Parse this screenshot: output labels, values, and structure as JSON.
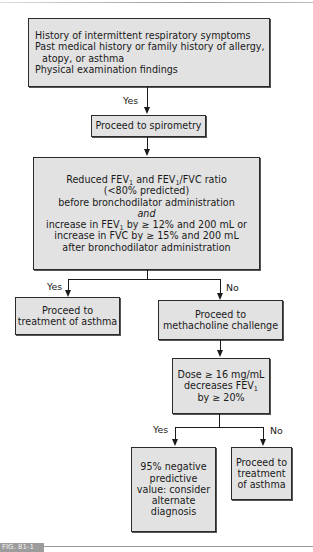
{
  "diagram": {
    "type": "flowchart",
    "nodes": {
      "history": {
        "lines": [
          "History of intermittent respiratory symptoms",
          "Past medical history or family history of allergy,",
          "atopy, or asthma",
          "Physical examination findings"
        ]
      },
      "spirometry": {
        "lines": [
          "Proceed to spirometry"
        ]
      },
      "criteria": {
        "line1_a": "Reduced FEV",
        "line1_sub1": "1",
        "line1_b": " and FEV",
        "line1_sub2": "1",
        "line1_c": "/FVC ratio",
        "line2": "(<80% predicted)",
        "line3": "before bronchodilator administration",
        "line4": "and",
        "line5_a": "increase in FEV",
        "line5_sub": "1",
        "line5_b": " by ≥ 12% and 200 mL or",
        "line6": "increase in FVC by ≥ 15% and 200 mL",
        "line7": "after bronchodilator administration"
      },
      "treat_asthma_1": {
        "lines": [
          "Proceed to",
          "treatment of asthma"
        ]
      },
      "methacholine": {
        "lines": [
          "Proceed to",
          "methacholine challenge"
        ]
      },
      "dose": {
        "line1": "Dose ≥ 16 mg/mL",
        "line2_a": "decreases FEV",
        "line2_sub": "1",
        "line3": "by ≥ 20%"
      },
      "negative_predictive": {
        "lines": [
          "95% negative",
          "predictive",
          "value: consider",
          "alternate",
          "diagnosis"
        ]
      },
      "treat_asthma_2": {
        "lines": [
          "Proceed to",
          "treatment",
          "of asthma"
        ]
      }
    },
    "edges": [
      {
        "from": "history",
        "to": "spirometry",
        "label": "Yes"
      },
      {
        "from": "spirometry",
        "to": "criteria",
        "label": ""
      },
      {
        "from": "criteria",
        "to": "treat_asthma_1",
        "label": "Yes"
      },
      {
        "from": "criteria",
        "to": "methacholine",
        "label": "No"
      },
      {
        "from": "methacholine",
        "to": "dose",
        "label": ""
      },
      {
        "from": "dose",
        "to": "negative_predictive",
        "label": "Yes"
      },
      {
        "from": "dose",
        "to": "treat_asthma_2",
        "label": "No"
      }
    ],
    "edge_labels": {
      "yes1": "Yes",
      "yes2": "Yes",
      "no2": "No",
      "yes3": "Yes",
      "no3": "No"
    },
    "figure_label": "FIG. 81-1"
  },
  "colors": {
    "box_fill": "#e2e2e2",
    "box_border": "#2a2a2a",
    "line": "#1a1a1a"
  }
}
